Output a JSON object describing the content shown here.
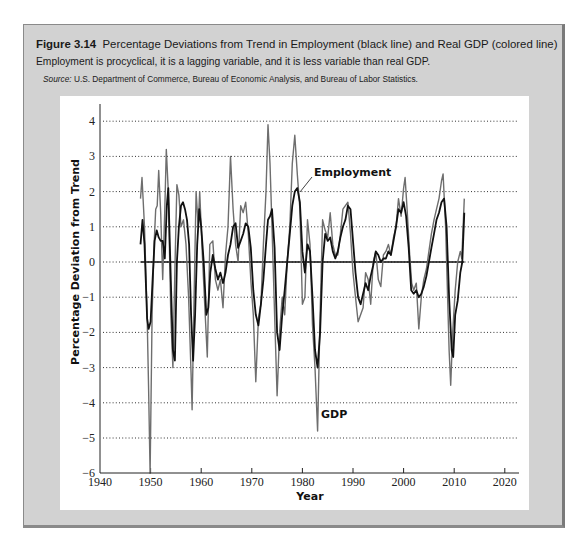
{
  "figure": {
    "number": "Figure 3.14",
    "title": "Percentage Deviations from Trend in Employment (black line) and Real GDP (colored line)",
    "subtitle": "Employment is procyclical, it is a lagging variable, and it is less variable than real GDP.",
    "source_label": "Source:",
    "source_text": "U.S. Department of Commerce, Bureau of Economic Analysis, and Bureau of Labor Statistics."
  },
  "colors": {
    "frame_bg": "#d2d2d2",
    "panel_bg": "#ffffff",
    "employment": "#111111",
    "gdp": "#6e6e6e",
    "grid": "#333333"
  },
  "chart_data": {
    "type": "line",
    "title": "Percentage Deviations from Trend in Employment (black line) and Real GDP (colored line)",
    "xlabel": "Year",
    "ylabel": "Percentage Deviation from Trend",
    "xlim": [
      1940,
      2022
    ],
    "ylim": [
      -6,
      4
    ],
    "xticks": [
      1940,
      1950,
      1960,
      1970,
      1980,
      1990,
      2000,
      2010,
      2020
    ],
    "yticks": [
      4,
      3,
      2,
      1,
      0,
      -1,
      -2,
      -3,
      -4,
      -5,
      -6
    ],
    "ytick_labels": [
      "4",
      "3",
      "2",
      "1",
      "0",
      "−1",
      "−2",
      "−3",
      "−4",
      "−5",
      "−6"
    ],
    "grid": "horizontal dotted",
    "zero_line": {
      "from": 1948,
      "to": 2012
    },
    "annotations": [
      {
        "text": "Employment",
        "series": "Employment",
        "x": 1980,
        "y": 2.3
      },
      {
        "text": "GDP",
        "series": "GDP",
        "x": 1983,
        "y": -4.3
      }
    ],
    "series": [
      {
        "name": "GDP",
        "color": "#6e6e6e",
        "x": [
          1948.0,
          1948.3,
          1948.8,
          1949.3,
          1949.6,
          1949.9,
          1950.3,
          1950.7,
          1951.0,
          1951.3,
          1951.6,
          1952.0,
          1952.4,
          1952.8,
          1953.1,
          1953.5,
          1954.0,
          1954.4,
          1954.8,
          1955.2,
          1955.6,
          1956.0,
          1956.5,
          1957.0,
          1957.5,
          1958.0,
          1958.2,
          1958.6,
          1959.0,
          1959.4,
          1959.7,
          1960.2,
          1960.8,
          1961.2,
          1961.7,
          1962.3,
          1962.8,
          1963.3,
          1963.8,
          1964.3,
          1964.8,
          1965.3,
          1965.8,
          1966.3,
          1966.8,
          1967.3,
          1967.8,
          1968.3,
          1968.8,
          1969.3,
          1969.8,
          1970.3,
          1970.8,
          1971.3,
          1971.8,
          1972.3,
          1972.8,
          1973.2,
          1973.6,
          1974.0,
          1974.5,
          1975.0,
          1975.5,
          1976.0,
          1976.5,
          1977.0,
          1977.5,
          1978.0,
          1978.5,
          1979.0,
          1979.5,
          1980.0,
          1980.5,
          1981.0,
          1981.5,
          1982.0,
          1982.5,
          1983.0,
          1983.5,
          1984.0,
          1984.5,
          1985.0,
          1985.5,
          1986.0,
          1986.5,
          1987.0,
          1987.5,
          1988.0,
          1988.5,
          1989.0,
          1989.5,
          1990.0,
          1990.5,
          1991.0,
          1991.5,
          1992.0,
          1992.5,
          1993.0,
          1993.5,
          1994.0,
          1994.5,
          1995.0,
          1995.5,
          1996.0,
          1996.5,
          1997.0,
          1997.5,
          1998.0,
          1998.5,
          1999.0,
          1999.5,
          2000.0,
          2000.3,
          2000.7,
          2001.2,
          2001.6,
          2002.0,
          2002.5,
          2003.0,
          2003.5,
          2004.0,
          2004.5,
          2005.0,
          2005.5,
          2006.0,
          2006.5,
          2007.0,
          2007.5,
          2007.8,
          2008.3,
          2008.7,
          2009.0,
          2009.3,
          2009.7,
          2010.2,
          2010.7,
          2011.2,
          2011.5,
          2012.0
        ],
        "values": [
          1.8,
          2.4,
          1.0,
          -1.5,
          -3.6,
          -6.0,
          -1.5,
          0.5,
          1.5,
          1.6,
          2.6,
          1.4,
          -0.5,
          1.5,
          3.2,
          2.0,
          -1.5,
          -3.0,
          -0.2,
          2.2,
          1.9,
          1.0,
          1.2,
          0.5,
          -1.0,
          -3.2,
          -4.2,
          -1.0,
          2.0,
          1.0,
          2.0,
          0.3,
          -1.5,
          -2.7,
          0.5,
          0.6,
          -0.5,
          -0.8,
          -0.5,
          -1.3,
          0.2,
          1.0,
          3.0,
          1.5,
          0.5,
          0.0,
          1.6,
          1.4,
          1.7,
          0.8,
          -0.5,
          -1.5,
          -3.4,
          -1.6,
          -1.2,
          0.5,
          2.0,
          3.9,
          2.8,
          1.0,
          -1.5,
          -3.8,
          -2.0,
          -1.0,
          -1.5,
          0.0,
          1.0,
          2.8,
          3.6,
          2.5,
          1.5,
          -1.2,
          -1.0,
          1.2,
          0.5,
          -1.8,
          -3.0,
          -4.8,
          -1.5,
          1.2,
          0.9,
          0.7,
          1.4,
          0.5,
          0.2,
          0.2,
          0.8,
          1.5,
          1.6,
          1.7,
          0.8,
          -0.3,
          -1.0,
          -1.7,
          -1.5,
          -1.3,
          -0.3,
          -0.5,
          -1.2,
          0.0,
          0.3,
          -0.5,
          -0.7,
          0.2,
          0.3,
          0.5,
          0.2,
          0.7,
          1.0,
          1.8,
          1.3,
          2.1,
          2.4,
          1.5,
          0.2,
          -0.6,
          -0.8,
          -0.6,
          -1.9,
          -1.0,
          -0.5,
          -0.2,
          0.3,
          0.8,
          1.2,
          1.5,
          1.8,
          2.3,
          2.5,
          1.0,
          -1.0,
          -2.5,
          -3.5,
          -2.0,
          -0.8,
          0.0,
          0.3,
          0.1,
          1.8
        ]
      },
      {
        "name": "Employment",
        "color": "#111111",
        "x": [
          1948.0,
          1948.4,
          1948.8,
          1949.3,
          1949.6,
          1950.0,
          1950.4,
          1950.8,
          1951.2,
          1951.6,
          1952.0,
          1952.4,
          1952.8,
          1953.2,
          1953.5,
          1954.0,
          1954.4,
          1954.8,
          1955.2,
          1955.6,
          1956.0,
          1956.4,
          1956.8,
          1957.2,
          1957.6,
          1958.0,
          1958.4,
          1958.8,
          1959.2,
          1959.6,
          1960.0,
          1960.5,
          1961.0,
          1961.4,
          1961.8,
          1962.3,
          1962.8,
          1963.3,
          1963.8,
          1964.3,
          1964.8,
          1965.3,
          1965.8,
          1966.3,
          1966.8,
          1967.3,
          1967.8,
          1968.3,
          1968.8,
          1969.3,
          1969.8,
          1970.3,
          1970.8,
          1971.3,
          1971.8,
          1972.3,
          1972.8,
          1973.2,
          1973.6,
          1974.0,
          1974.5,
          1975.0,
          1975.5,
          1976.0,
          1976.5,
          1977.0,
          1977.5,
          1978.0,
          1978.5,
          1979.0,
          1979.5,
          1980.0,
          1980.5,
          1981.0,
          1981.5,
          1982.0,
          1982.5,
          1983.0,
          1983.5,
          1984.0,
          1984.5,
          1985.0,
          1985.5,
          1986.0,
          1986.5,
          1987.0,
          1987.5,
          1988.0,
          1988.5,
          1989.0,
          1989.5,
          1990.0,
          1990.5,
          1991.0,
          1991.5,
          1992.0,
          1992.5,
          1993.0,
          1993.5,
          1994.0,
          1994.5,
          1995.0,
          1995.5,
          1996.0,
          1996.5,
          1997.0,
          1997.5,
          1998.0,
          1998.5,
          1999.0,
          1999.5,
          2000.0,
          2000.5,
          2001.0,
          2001.5,
          2002.0,
          2002.5,
          2003.0,
          2003.5,
          2004.0,
          2004.5,
          2005.0,
          2005.5,
          2006.0,
          2006.5,
          2007.0,
          2007.5,
          2008.0,
          2008.5,
          2009.0,
          2009.5,
          2009.8,
          2010.2,
          2010.7,
          2011.2,
          2011.6,
          2012.0
        ],
        "values": [
          0.5,
          1.2,
          0.5,
          -1.6,
          -1.9,
          -1.7,
          -0.5,
          0.6,
          0.9,
          0.7,
          0.6,
          0.6,
          0.1,
          1.6,
          2.1,
          -0.5,
          -2.5,
          -2.8,
          0.0,
          1.0,
          1.6,
          1.7,
          1.5,
          1.2,
          0.5,
          -1.5,
          -2.8,
          -1.5,
          0.5,
          1.5,
          1.0,
          0.0,
          -1.5,
          -1.3,
          -0.3,
          0.2,
          -0.2,
          -0.5,
          -0.3,
          -0.6,
          -0.3,
          0.2,
          0.5,
          1.0,
          1.1,
          0.4,
          0.6,
          0.8,
          1.1,
          1.0,
          0.4,
          -0.8,
          -1.5,
          -1.8,
          -1.2,
          -0.5,
          0.5,
          1.2,
          1.3,
          1.5,
          0.4,
          -2.0,
          -2.5,
          -1.5,
          -0.8,
          0.0,
          0.8,
          1.6,
          2.0,
          2.1,
          1.7,
          0.3,
          -0.3,
          0.5,
          0.3,
          -1.0,
          -2.5,
          -3.0,
          -2.0,
          0.0,
          0.8,
          0.6,
          0.7,
          0.3,
          0.1,
          0.3,
          0.7,
          1.0,
          1.2,
          1.6,
          1.5,
          0.6,
          -0.3,
          -1.0,
          -1.2,
          -0.9,
          -0.6,
          -0.8,
          -0.4,
          -0.1,
          0.3,
          0.2,
          0.0,
          0.1,
          0.1,
          0.3,
          0.2,
          0.6,
          1.0,
          1.5,
          1.4,
          1.7,
          1.3,
          0.4,
          -0.8,
          -0.9,
          -0.8,
          -1.0,
          -0.9,
          -0.7,
          -0.4,
          0.0,
          0.4,
          0.8,
          1.2,
          1.4,
          1.7,
          1.8,
          1.0,
          -1.0,
          -2.5,
          -2.7,
          -1.5,
          -1.1,
          -0.3,
          0.0,
          1.4
        ]
      }
    ]
  }
}
